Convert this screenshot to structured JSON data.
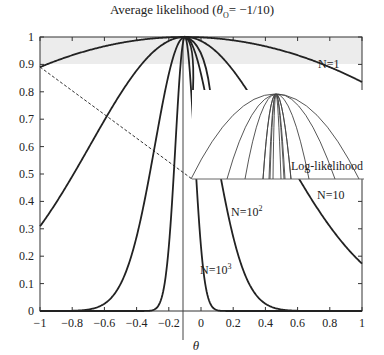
{
  "chart_data": {
    "type": "line",
    "title_prefix": "Average likelihood (",
    "title_theta": "θ",
    "title_sub": "O",
    "title_suffix": "= −1/10)",
    "xlabel": "θ",
    "ylabel": "",
    "xlim": [
      -1,
      1
    ],
    "ylim": [
      0,
      1
    ],
    "x_ticks": [
      "−1",
      "−0.8",
      "−0.6",
      "−0.4",
      "−0.2",
      "0",
      "0.2",
      "0.4",
      "0.6",
      "0.8",
      "1"
    ],
    "x_tick_values": [
      -1,
      -0.8,
      -0.6,
      -0.4,
      -0.2,
      0,
      0.2,
      0.4,
      0.6,
      0.8,
      1
    ],
    "y_ticks": [
      "0",
      "0.1",
      "0.2",
      "0.3",
      "0.4",
      "0.5",
      "0.6",
      "0.7",
      "0.8",
      "0.9",
      "1"
    ],
    "y_tick_values": [
      0,
      0.1,
      0.2,
      0.3,
      0.4,
      0.5,
      0.6,
      0.7,
      0.8,
      0.9,
      1
    ],
    "grid": false,
    "shaded_band": {
      "y_from": 0.9,
      "y_to": 1.0,
      "color": "#ececec"
    },
    "theta_0": -0.1,
    "series": [
      {
        "name": "N=1",
        "label": "N=1",
        "x": [
          -1,
          -0.8,
          -0.6,
          -0.4,
          -0.2,
          -0.1,
          0,
          0.2,
          0.4,
          0.6,
          0.8,
          1
        ],
        "values": [
          0.89,
          0.935,
          0.965,
          0.985,
          0.997,
          1.0,
          0.997,
          0.985,
          0.965,
          0.935,
          0.89,
          0.83
        ]
      },
      {
        "name": "N=10",
        "label": "N=10",
        "x": [
          -1,
          -0.8,
          -0.6,
          -0.4,
          -0.2,
          -0.1,
          0,
          0.2,
          0.4,
          0.6,
          0.8,
          1
        ],
        "values": [
          0.3,
          0.52,
          0.72,
          0.87,
          0.97,
          1.0,
          0.97,
          0.87,
          0.72,
          0.52,
          0.35,
          0.18
        ]
      },
      {
        "name": "N=10^2",
        "label": "N=10²",
        "x": [
          -1,
          -0.8,
          -0.6,
          -0.4,
          -0.3,
          -0.2,
          -0.1,
          0,
          0.1,
          0.2,
          0.4,
          0.6,
          0.8,
          1
        ],
        "values": [
          0,
          0.002,
          0.08,
          0.42,
          0.65,
          0.88,
          1.0,
          0.88,
          0.65,
          0.42,
          0.08,
          0.002,
          0,
          0
        ]
      },
      {
        "name": "N=10^3",
        "label": "N=10³",
        "x": [
          -1,
          -0.4,
          -0.3,
          -0.25,
          -0.2,
          -0.15,
          -0.1,
          -0.05,
          0,
          0.05,
          0.1,
          0.2,
          1
        ],
        "values": [
          0,
          0,
          0.01,
          0.1,
          0.35,
          0.75,
          1.0,
          0.75,
          0.35,
          0.1,
          0.01,
          0,
          0
        ]
      },
      {
        "name": "dashed-tangent",
        "label": "",
        "style": "dashed",
        "x": [
          -1,
          -0.07
        ],
        "values": [
          0.89,
          0.415
        ]
      }
    ],
    "inset": {
      "label": "Log-likelihood",
      "description": "Inverted parabolas (log-likelihood) for increasing N, all peaking at theta_0"
    },
    "annotations": [
      {
        "text": "N=1",
        "x": 0.75,
        "y": 0.92
      },
      {
        "text": "N=10",
        "x": 0.8,
        "y": 0.42
      },
      {
        "text": "N=10²",
        "x": 0.18,
        "y": 0.32
      },
      {
        "text": "N=10³",
        "x": 0.05,
        "y": 0.16
      },
      {
        "text": "Log-likelihood",
        "x": 0.78,
        "y": 0.51
      }
    ]
  }
}
